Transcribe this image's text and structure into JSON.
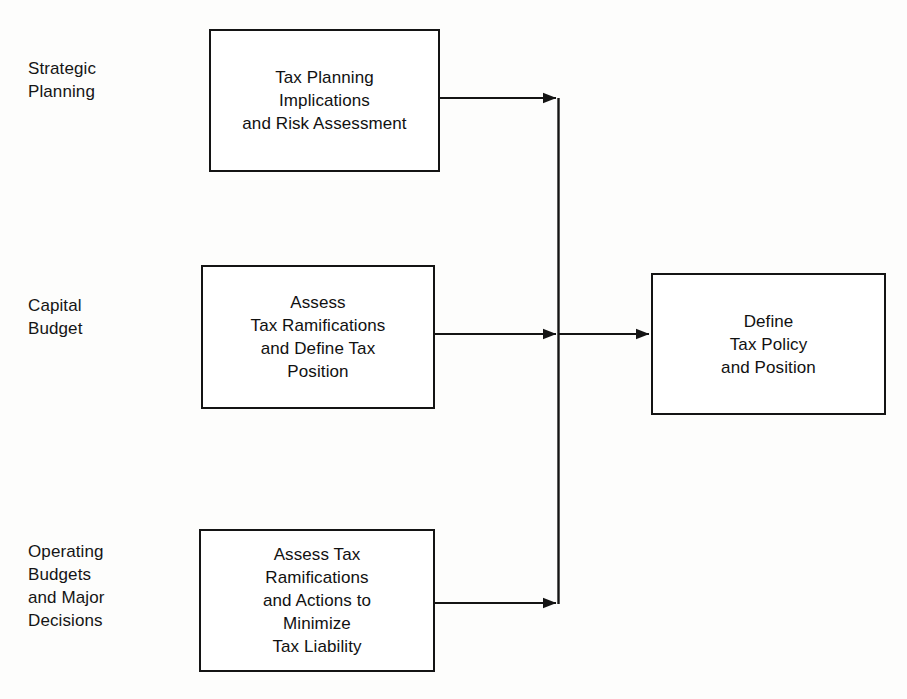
{
  "diagram": {
    "background_color": "#fdfdfc",
    "line_color": "#141414",
    "text_color": "#111111",
    "stage_labels": [
      {
        "name": "strategic-planning",
        "text": "Strategic\nPlanning"
      },
      {
        "name": "capital-budget",
        "text": "Capital\nBudget"
      },
      {
        "name": "operating-budgets",
        "text": "Operating\nBudgets\nand Major\nDecisions"
      }
    ],
    "process_boxes": [
      {
        "name": "tax-planning-implications",
        "text": "Tax Planning\nImplications\nand Risk Assessment"
      },
      {
        "name": "assess-tax-ramifications",
        "text": "Assess\nTax Ramifications\nand Define Tax\nPosition"
      },
      {
        "name": "assess-tax-minimize-liability",
        "text": "Assess Tax\nRamifications\nand Actions to\nMinimize\nTax Liability"
      }
    ],
    "outcome_box": {
      "name": "define-tax-policy",
      "text": "Define\nTax Policy\nand Position"
    },
    "connectors": [
      {
        "name": "connector-strategic-to-bus",
        "from": "tax-planning-implications",
        "to": "vertical-bus"
      },
      {
        "name": "connector-capital-to-bus",
        "from": "assess-tax-ramifications",
        "to": "vertical-bus"
      },
      {
        "name": "connector-operating-to-bus",
        "from": "assess-tax-minimize-liability",
        "to": "vertical-bus"
      },
      {
        "name": "connector-bus-to-outcome",
        "from": "vertical-bus",
        "to": "define-tax-policy"
      }
    ]
  }
}
